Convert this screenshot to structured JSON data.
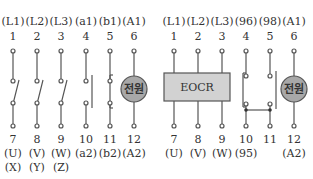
{
  "diagram": {
    "left": {
      "title": "Magnetic contactor (MC) terminal diagram",
      "top_labels": [
        "(L1)",
        "(L2)",
        "(L3)",
        "(a1)",
        "(b1)",
        "(A1)"
      ],
      "top_numbers": [
        "1",
        "2",
        "3",
        "4",
        "5",
        "6"
      ],
      "bottom_numbers": [
        "7",
        "8",
        "9",
        "10",
        "11",
        "12"
      ],
      "bottom_labels": [
        "(U)",
        "(V)",
        "(W)",
        "(a2)",
        "(b2)",
        "(A2)"
      ],
      "bottom_labels_2": [
        "(X)",
        "(Y)",
        "(Z)",
        "",
        "",
        ""
      ],
      "coil_label": "전원"
    },
    "right": {
      "title": "EOCR terminal diagram",
      "top_labels": [
        "(L1)",
        "(L2)",
        "(L3)",
        "(96)",
        "(98)",
        "(A1)"
      ],
      "top_numbers": [
        "1",
        "2",
        "3",
        "4",
        "5",
        "6"
      ],
      "bottom_numbers": [
        "7",
        "8",
        "9",
        "10",
        "11",
        "12"
      ],
      "bottom_labels": [
        "(U)",
        "(V)",
        "(W)",
        "(95)",
        "",
        "(A2)"
      ],
      "box_label": "EOCR",
      "coil_label": "전원"
    },
    "colors": {
      "line": "#555555",
      "coil_fill": "#a8a8a8",
      "box_fill": "#d2d2d2",
      "text": "#333333"
    }
  }
}
